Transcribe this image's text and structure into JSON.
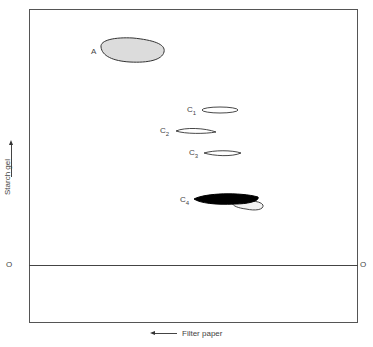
{
  "diagram": {
    "axes": {
      "x_label": "Filter paper",
      "x_direction": "left",
      "y_label": "Starch gel",
      "y_direction": "up",
      "origin_left": "O",
      "origin_right": "O"
    },
    "spots": [
      {
        "id": "A",
        "label": "A",
        "fill": "#d8d8d8",
        "outline": "#333333"
      },
      {
        "id": "C1",
        "label": "C",
        "subscript": "1",
        "fill": "#ffffff",
        "outline": "#333333"
      },
      {
        "id": "C2",
        "label": "C",
        "subscript": "2",
        "fill": "#ffffff",
        "outline": "#333333"
      },
      {
        "id": "C3",
        "label": "C",
        "subscript": "3",
        "fill": "#ffffff",
        "outline": "#333333"
      },
      {
        "id": "C4",
        "label": "C",
        "subscript": "4",
        "fill": "#000000",
        "outline": "#000000"
      }
    ]
  }
}
